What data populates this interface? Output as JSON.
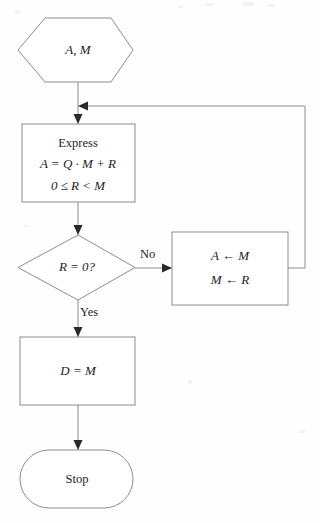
{
  "figure": {
    "type": "flowchart",
    "title": "",
    "background_color": "#fefefe",
    "line_color": "#8c8c8c",
    "text_color": "#1d1d1d",
    "arrow_color": "#2a2a2a"
  },
  "nodes": {
    "input": {
      "shape": "hexagon",
      "name": "input-node",
      "text": "A, M"
    },
    "express": {
      "shape": "rectangle",
      "name": "express-process-node",
      "line1": "Express",
      "line2": "A = Q · M + R",
      "line3": "0 ≤ R < M"
    },
    "decision": {
      "shape": "diamond",
      "name": "remainder-zero-decision-node",
      "text": "R = 0?"
    },
    "update": {
      "shape": "rectangle",
      "name": "update-assignment-node",
      "line1": "A ← M",
      "line2": "M ← R"
    },
    "result": {
      "shape": "rectangle",
      "name": "result-node",
      "text": "D = M"
    },
    "stop": {
      "shape": "stadium",
      "name": "stop-terminal-node",
      "text": "Stop"
    }
  },
  "edge_labels": {
    "no": "No",
    "yes": "Yes"
  }
}
